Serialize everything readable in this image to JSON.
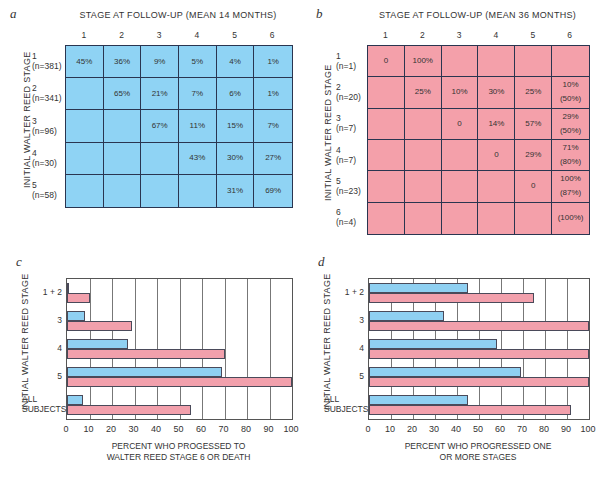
{
  "colors": {
    "blue": "#8fd3f4",
    "pink": "#f4a0aa",
    "grid_line": "#2a3550"
  },
  "panel_a": {
    "letter": "a",
    "title": "STAGE AT FOLLOW-UP (MEAN 14 MONTHS)",
    "ylabel": "INITIAL WALTER REED STAGE",
    "columns": [
      "1",
      "2",
      "3",
      "4",
      "5",
      "6"
    ],
    "rows": [
      {
        "stage": "1",
        "n": "(n=381)",
        "cells": [
          [
            "45%"
          ],
          [
            "36%"
          ],
          [
            "9%"
          ],
          [
            "5%"
          ],
          [
            "4%"
          ],
          [
            "1%"
          ]
        ]
      },
      {
        "stage": "2",
        "n": "(n=341)",
        "cells": [
          [],
          [
            "65%"
          ],
          [
            "21%"
          ],
          [
            "7%"
          ],
          [
            "6%"
          ],
          [
            "1%"
          ]
        ]
      },
      {
        "stage": "3",
        "n": "(n=96)",
        "cells": [
          [],
          [],
          [
            "67%"
          ],
          [
            "11%"
          ],
          [
            "15%"
          ],
          [
            "7%"
          ]
        ]
      },
      {
        "stage": "4",
        "n": "(n=30)",
        "cells": [
          [],
          [],
          [],
          [
            "43%"
          ],
          [
            "30%"
          ],
          [
            "27%"
          ]
        ]
      },
      {
        "stage": "5",
        "n": "(n=58)",
        "cells": [
          [],
          [],
          [],
          [],
          [
            "31%"
          ],
          [
            "69%"
          ]
        ]
      }
    ]
  },
  "panel_b": {
    "letter": "b",
    "title": "STAGE AT FOLLOW-UP (MEAN 36 MONTHS)",
    "ylabel": "INITIAL WALTER REED STAGE",
    "columns": [
      "1",
      "2",
      "3",
      "4",
      "5",
      "6"
    ],
    "rows": [
      {
        "stage": "1",
        "n": "(n=1)",
        "cells": [
          [
            "0"
          ],
          [
            "100%"
          ],
          [],
          [],
          [],
          []
        ]
      },
      {
        "stage": "2",
        "n": "(n=20)",
        "cells": [
          [],
          [
            "25%"
          ],
          [
            "10%"
          ],
          [
            "30%"
          ],
          [
            "25%"
          ],
          [
            "10%",
            "(50%)"
          ]
        ]
      },
      {
        "stage": "3",
        "n": "(n=7)",
        "cells": [
          [],
          [],
          [
            "0"
          ],
          [
            "14%"
          ],
          [
            "57%"
          ],
          [
            "29%",
            "(50%)"
          ]
        ]
      },
      {
        "stage": "4",
        "n": "(n=7)",
        "cells": [
          [],
          [],
          [],
          [
            "0"
          ],
          [
            "29%"
          ],
          [
            "71%",
            "(80%)"
          ]
        ]
      },
      {
        "stage": "5",
        "n": "(n=23)",
        "cells": [
          [],
          [],
          [],
          [],
          [
            "0"
          ],
          [
            "100%",
            "(87%)"
          ]
        ]
      },
      {
        "stage": "6",
        "n": "(n=4)",
        "cells": [
          [],
          [],
          [],
          [],
          [],
          [
            "(100%)"
          ]
        ]
      }
    ]
  },
  "chart_data": [
    {
      "type": "table",
      "title": "STAGE AT FOLLOW-UP (MEAN 14 MONTHS)",
      "ylabel": "INITIAL WALTER REED STAGE",
      "columns": [
        "1",
        "2",
        "3",
        "4",
        "5",
        "6"
      ],
      "rows": [
        {
          "stage": "1",
          "n": 381,
          "values": [
            45,
            36,
            9,
            5,
            4,
            1
          ]
        },
        {
          "stage": "2",
          "n": 341,
          "values": [
            null,
            65,
            21,
            7,
            6,
            1
          ]
        },
        {
          "stage": "3",
          "n": 96,
          "values": [
            null,
            null,
            67,
            11,
            15,
            7
          ]
        },
        {
          "stage": "4",
          "n": 30,
          "values": [
            null,
            null,
            null,
            43,
            30,
            27
          ]
        },
        {
          "stage": "5",
          "n": 58,
          "values": [
            null,
            null,
            null,
            null,
            31,
            69
          ]
        }
      ]
    },
    {
      "type": "table",
      "title": "STAGE AT FOLLOW-UP (MEAN 36 MONTHS)",
      "ylabel": "INITIAL WALTER REED STAGE",
      "columns": [
        "1",
        "2",
        "3",
        "4",
        "5",
        "6"
      ],
      "rows": [
        {
          "stage": "1",
          "n": 1,
          "values": [
            0,
            100,
            null,
            null,
            null,
            null
          ]
        },
        {
          "stage": "2",
          "n": 20,
          "values": [
            null,
            25,
            10,
            30,
            25,
            "10 (50)"
          ]
        },
        {
          "stage": "3",
          "n": 7,
          "values": [
            null,
            null,
            0,
            14,
            57,
            "29 (50)"
          ]
        },
        {
          "stage": "4",
          "n": 7,
          "values": [
            null,
            null,
            null,
            0,
            29,
            "71 (80)"
          ]
        },
        {
          "stage": "5",
          "n": 23,
          "values": [
            null,
            null,
            null,
            null,
            0,
            "100 (87)"
          ]
        },
        {
          "stage": "6",
          "n": 4,
          "values": [
            null,
            null,
            null,
            null,
            null,
            "(100)"
          ]
        }
      ]
    },
    {
      "type": "bar",
      "orientation": "horizontal",
      "categories": [
        "1 + 2",
        "3",
        "4",
        "5",
        "ALL SUBJECTS"
      ],
      "series": [
        {
          "name": "14-month follow-up",
          "color": "#8fd3f4",
          "values": [
            1,
            8,
            27,
            69,
            7
          ]
        },
        {
          "name": "36-month follow-up",
          "color": "#f4a0aa",
          "values": [
            10,
            29,
            70,
            100,
            55
          ]
        }
      ],
      "xlabel": "PERCENT WHO PROGESSED TO WALTER REED STAGE 6 OR DEATH",
      "ylabel": "INITIAL WALTER REED STAGE",
      "xlim": [
        0,
        100
      ],
      "xticks": [
        0,
        10,
        20,
        30,
        40,
        50,
        60,
        70,
        80,
        90,
        100
      ],
      "grid": true
    },
    {
      "type": "bar",
      "orientation": "horizontal",
      "categories": [
        "1 + 2",
        "3",
        "4",
        "5",
        "ALL SUBJECTS"
      ],
      "series": [
        {
          "name": "14-month follow-up",
          "color": "#8fd3f4",
          "values": [
            45,
            34,
            58,
            69,
            45
          ]
        },
        {
          "name": "36-month follow-up",
          "color": "#f4a0aa",
          "values": [
            75,
            100,
            100,
            100,
            92
          ]
        }
      ],
      "xlabel": "PERCENT WHO PROGRESSED ONE OR MORE STAGES",
      "ylabel": "INITIAL WALTER REED STAGE",
      "xlim": [
        0,
        100
      ],
      "xticks": [
        0,
        10,
        20,
        30,
        40,
        50,
        60,
        70,
        80,
        90,
        100
      ],
      "grid": true
    }
  ],
  "panel_c": {
    "letter": "c",
    "ylabel": "INITIAL WALTER REED STAGE",
    "categories": [
      "1 + 2",
      "3",
      "4",
      "5",
      "ALL|SUBJECTS"
    ],
    "blue": [
      1,
      8,
      27,
      69,
      7
    ],
    "pink": [
      10,
      29,
      70,
      100,
      55
    ],
    "ticks": [
      "0",
      "10",
      "20",
      "30",
      "40",
      "50",
      "60",
      "70",
      "80",
      "90",
      "100"
    ],
    "xlabel_line1": "PERCENT WHO PROGESSED TO",
    "xlabel_line2": "WALTER REED STAGE 6 OR DEATH"
  },
  "panel_d": {
    "letter": "d",
    "ylabel": "INITIAL WALTER REED STAGE",
    "categories": [
      "1 + 2",
      "3",
      "4",
      "5",
      "ALL|SUBJECTS"
    ],
    "blue": [
      45,
      34,
      58,
      69,
      45
    ],
    "pink": [
      75,
      100,
      100,
      100,
      92
    ],
    "ticks": [
      "0",
      "10",
      "20",
      "30",
      "40",
      "50",
      "60",
      "70",
      "80",
      "90",
      "100"
    ],
    "xlabel_line1": "PERCENT WHO PROGRESSED ONE",
    "xlabel_line2": "OR MORE STAGES"
  }
}
